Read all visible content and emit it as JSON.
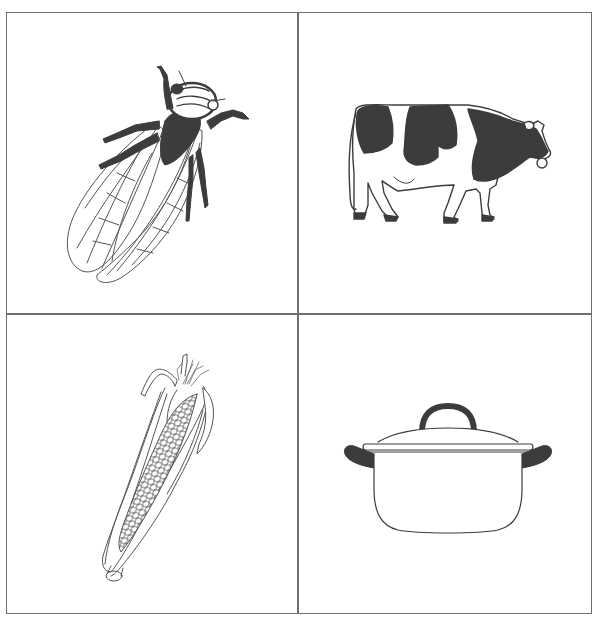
{
  "grid": {
    "rows": 2,
    "columns": 2,
    "border_color": "#6f6f6f",
    "cells": [
      {
        "position": "top-left",
        "subject": "cicada",
        "icon": "cicada-icon",
        "label": "cicada"
      },
      {
        "position": "top-right",
        "subject": "cow",
        "icon": "cow-icon",
        "label": "cow"
      },
      {
        "position": "bottom-left",
        "subject": "corn",
        "icon": "corn-icon",
        "label": "corn"
      },
      {
        "position": "bottom-right",
        "subject": "pot",
        "icon": "pot-icon",
        "label": "pot"
      }
    ]
  },
  "colors": {
    "ink": "#3c3c3c",
    "line": "#555555",
    "background": "#ffffff"
  }
}
